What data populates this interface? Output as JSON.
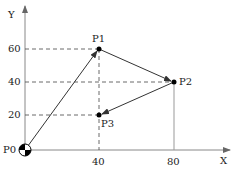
{
  "diagram": {
    "axes": {
      "x_label": "X",
      "y_label": "Y"
    },
    "x_ticks": [
      "40",
      "80"
    ],
    "y_ticks": [
      "60",
      "40",
      "20"
    ],
    "points": [
      {
        "name": "P0",
        "x": 0,
        "y": 0
      },
      {
        "name": "P1",
        "x": 40,
        "y": 60
      },
      {
        "name": "P2",
        "x": 80,
        "y": 40
      },
      {
        "name": "P3",
        "x": 40,
        "y": 20
      }
    ],
    "path": [
      "P0",
      "P1",
      "P2",
      "P3"
    ],
    "colors": {
      "line": "#333333",
      "axis": "#888888",
      "dash": "#444444"
    }
  }
}
